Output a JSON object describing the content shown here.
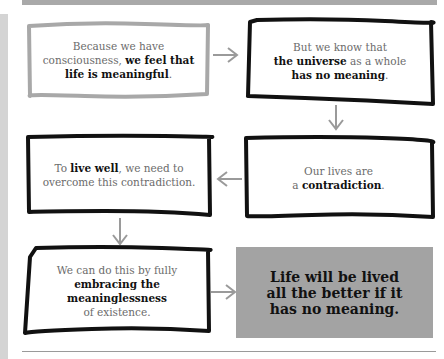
{
  "colors": {
    "light_border": "#a8a8a8",
    "dark_border": "#111111",
    "arrow": "#9a9a9a",
    "final_fill": "#a3a3a3",
    "text_gray": "#6b6b6b",
    "text_bold": "#111111"
  },
  "boxes": [
    {
      "id": "box1",
      "parts": [
        "Because we have",
        "consciousness, ",
        "we feel that",
        "life is meaningful",
        "."
      ]
    },
    {
      "id": "box2",
      "parts": [
        "But we know that",
        "the universe",
        " as a whole",
        "has no meaning",
        "."
      ]
    },
    {
      "id": "box3",
      "parts": [
        "To ",
        "live well",
        ", we need to",
        "overcome this contradiction."
      ]
    },
    {
      "id": "box4",
      "parts": [
        "Our lives are",
        "a ",
        "contradiction",
        "."
      ]
    },
    {
      "id": "box5",
      "parts": [
        "We can do this by fully",
        "embracing the",
        "meaninglessness",
        "of existence."
      ]
    }
  ],
  "conclusion": {
    "lines": [
      "Life will be lived",
      "all the better if it",
      "has no meaning."
    ]
  },
  "arrows": [
    {
      "from": "box1",
      "to": "box2",
      "direction": "right"
    },
    {
      "from": "box2",
      "to": "box4",
      "direction": "down"
    },
    {
      "from": "box4",
      "to": "box3",
      "direction": "left"
    },
    {
      "from": "box3",
      "to": "box5",
      "direction": "down"
    },
    {
      "from": "box5",
      "to": "conclusion",
      "direction": "right"
    }
  ]
}
